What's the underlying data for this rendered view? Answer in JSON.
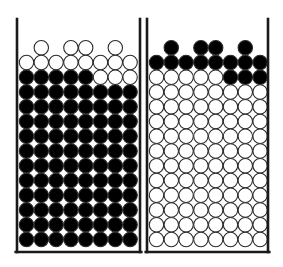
{
  "figure": {
    "kind": "two-container-particle-diagram",
    "canvas": {
      "width": 283,
      "height": 267,
      "background": "#ffffff"
    }
  },
  "style": {
    "wall_color": "#1a1a1a",
    "wall_thickness": 2.6,
    "base_thickness": 2.6,
    "circle_fill_filled": "#000000",
    "circle_fill_open": "#ffffff",
    "circle_stroke": "#2b2b2b",
    "circle_stroke_width": 1.1,
    "circle_radius": 7.2
  },
  "geometry": {
    "columns": 8,
    "rows": 13,
    "column_pitch": 14.8,
    "row_pitch": 14.75,
    "partial_row_columns": [
      2,
      4,
      5,
      7
    ],
    "base_y": 252,
    "first_row_center_y": 62.5
  },
  "containers": [
    {
      "id": "container-left",
      "name": "left-container",
      "left_wall_x": 17,
      "right_wall_x": 140,
      "top_y": 19,
      "first_column_center_x": 26.5,
      "partial_top_row": {
        "state": "open",
        "count": 4
      },
      "rows": [
        {
          "index": 1,
          "pattern": "open",
          "filled_count": 0,
          "open_count": 8,
          "cells": [
            "open",
            "open",
            "open",
            "open",
            "open",
            "open",
            "open",
            "open"
          ]
        },
        {
          "index": 2,
          "pattern": "mixed",
          "filled_count": 5,
          "open_count": 3,
          "cells": [
            "filled",
            "filled",
            "filled",
            "filled",
            "filled",
            "open",
            "open",
            "open"
          ]
        },
        {
          "index": 3,
          "pattern": "filled",
          "filled_count": 8,
          "open_count": 0,
          "cells": [
            "filled",
            "filled",
            "filled",
            "filled",
            "filled",
            "filled",
            "filled",
            "filled"
          ]
        },
        {
          "index": 4,
          "pattern": "filled",
          "filled_count": 8,
          "open_count": 0,
          "cells": [
            "filled",
            "filled",
            "filled",
            "filled",
            "filled",
            "filled",
            "filled",
            "filled"
          ]
        },
        {
          "index": 5,
          "pattern": "filled",
          "filled_count": 8,
          "open_count": 0,
          "cells": [
            "filled",
            "filled",
            "filled",
            "filled",
            "filled",
            "filled",
            "filled",
            "filled"
          ]
        },
        {
          "index": 6,
          "pattern": "filled",
          "filled_count": 8,
          "open_count": 0,
          "cells": [
            "filled",
            "filled",
            "filled",
            "filled",
            "filled",
            "filled",
            "filled",
            "filled"
          ]
        },
        {
          "index": 7,
          "pattern": "filled",
          "filled_count": 8,
          "open_count": 0,
          "cells": [
            "filled",
            "filled",
            "filled",
            "filled",
            "filled",
            "filled",
            "filled",
            "filled"
          ]
        },
        {
          "index": 8,
          "pattern": "filled",
          "filled_count": 8,
          "open_count": 0,
          "cells": [
            "filled",
            "filled",
            "filled",
            "filled",
            "filled",
            "filled",
            "filled",
            "filled"
          ]
        },
        {
          "index": 9,
          "pattern": "filled",
          "filled_count": 8,
          "open_count": 0,
          "cells": [
            "filled",
            "filled",
            "filled",
            "filled",
            "filled",
            "filled",
            "filled",
            "filled"
          ]
        },
        {
          "index": 10,
          "pattern": "filled",
          "filled_count": 8,
          "open_count": 0,
          "cells": [
            "filled",
            "filled",
            "filled",
            "filled",
            "filled",
            "filled",
            "filled",
            "filled"
          ]
        },
        {
          "index": 11,
          "pattern": "filled",
          "filled_count": 8,
          "open_count": 0,
          "cells": [
            "filled",
            "filled",
            "filled",
            "filled",
            "filled",
            "filled",
            "filled",
            "filled"
          ]
        },
        {
          "index": 12,
          "pattern": "filled",
          "filled_count": 8,
          "open_count": 0,
          "cells": [
            "filled",
            "filled",
            "filled",
            "filled",
            "filled",
            "filled",
            "filled",
            "filled"
          ]
        },
        {
          "index": 13,
          "pattern": "filled",
          "filled_count": 8,
          "open_count": 0,
          "cells": [
            "filled",
            "filled",
            "filled",
            "filled",
            "filled",
            "filled",
            "filled",
            "filled"
          ]
        }
      ],
      "totals": {
        "filled": 93,
        "open": 15,
        "all": 108
      }
    },
    {
      "id": "container-right",
      "name": "right-container",
      "left_wall_x": 147,
      "right_wall_x": 268,
      "top_y": 19,
      "first_column_center_x": 156.5,
      "partial_top_row": {
        "state": "filled",
        "count": 4
      },
      "rows": [
        {
          "index": 1,
          "pattern": "filled",
          "filled_count": 8,
          "open_count": 0,
          "cells": [
            "filled",
            "filled",
            "filled",
            "filled",
            "filled",
            "filled",
            "filled",
            "filled"
          ]
        },
        {
          "index": 2,
          "pattern": "mixed",
          "filled_count": 3,
          "open_count": 5,
          "cells": [
            "open",
            "open",
            "open",
            "open",
            "open",
            "filled",
            "filled",
            "filled"
          ]
        },
        {
          "index": 3,
          "pattern": "open",
          "filled_count": 0,
          "open_count": 8,
          "cells": [
            "open",
            "open",
            "open",
            "open",
            "open",
            "open",
            "open",
            "open"
          ]
        },
        {
          "index": 4,
          "pattern": "open",
          "filled_count": 0,
          "open_count": 8,
          "cells": [
            "open",
            "open",
            "open",
            "open",
            "open",
            "open",
            "open",
            "open"
          ]
        },
        {
          "index": 5,
          "pattern": "open",
          "filled_count": 0,
          "open_count": 8,
          "cells": [
            "open",
            "open",
            "open",
            "open",
            "open",
            "open",
            "open",
            "open"
          ]
        },
        {
          "index": 6,
          "pattern": "open",
          "filled_count": 0,
          "open_count": 8,
          "cells": [
            "open",
            "open",
            "open",
            "open",
            "open",
            "open",
            "open",
            "open"
          ]
        },
        {
          "index": 7,
          "pattern": "open",
          "filled_count": 0,
          "open_count": 8,
          "cells": [
            "open",
            "open",
            "open",
            "open",
            "open",
            "open",
            "open",
            "open"
          ]
        },
        {
          "index": 8,
          "pattern": "open",
          "filled_count": 0,
          "open_count": 8,
          "cells": [
            "open",
            "open",
            "open",
            "open",
            "open",
            "open",
            "open",
            "open"
          ]
        },
        {
          "index": 9,
          "pattern": "open",
          "filled_count": 0,
          "open_count": 8,
          "cells": [
            "open",
            "open",
            "open",
            "open",
            "open",
            "open",
            "open",
            "open"
          ]
        },
        {
          "index": 10,
          "pattern": "open",
          "filled_count": 0,
          "open_count": 8,
          "cells": [
            "open",
            "open",
            "open",
            "open",
            "open",
            "open",
            "open",
            "open"
          ]
        },
        {
          "index": 11,
          "pattern": "open",
          "filled_count": 0,
          "open_count": 8,
          "cells": [
            "open",
            "open",
            "open",
            "open",
            "open",
            "open",
            "open",
            "open"
          ]
        },
        {
          "index": 12,
          "pattern": "open",
          "filled_count": 0,
          "open_count": 8,
          "cells": [
            "open",
            "open",
            "open",
            "open",
            "open",
            "open",
            "open",
            "open"
          ]
        },
        {
          "index": 13,
          "pattern": "open",
          "filled_count": 0,
          "open_count": 8,
          "cells": [
            "open",
            "open",
            "open",
            "open",
            "open",
            "open",
            "open",
            "open"
          ]
        }
      ],
      "totals": {
        "filled": 15,
        "open": 93,
        "all": 108
      }
    }
  ]
}
